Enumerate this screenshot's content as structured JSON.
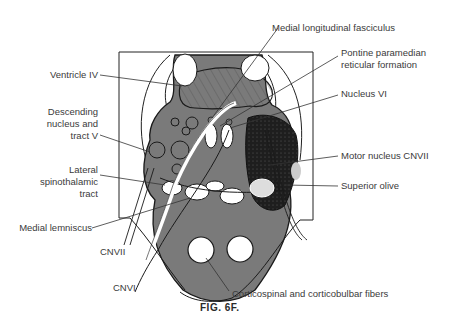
{
  "figure": {
    "caption": "FIG. 6F.",
    "colors": {
      "background": "#ffffff",
      "gray_tissue": "#7a7a7a",
      "dark_tissue": "#1e1e1e",
      "outline": "#1a1a1a",
      "label_text": "#3a3a3a"
    }
  },
  "labels": {
    "left": {
      "ventricle_iv": "Ventricle IV",
      "descending_nucleus_line1": "Descending",
      "descending_nucleus_line2": "nucleus and",
      "descending_nucleus_line3": "tract V",
      "lateral_spinothalamic_line1": "Lateral",
      "lateral_spinothalamic_line2": "spinothalamic",
      "lateral_spinothalamic_line3": "tract",
      "medial_lemniscus": "Medial lemniscus",
      "cnvii": "CNVII",
      "cnvi": "CNVI"
    },
    "right": {
      "medial_longitudinal_fasciculus": "Medial longitudinal fasciculus",
      "pontine_paramedian_line1": "Pontine paramedian",
      "pontine_paramedian_line2": "reticular formation",
      "nucleus_vi": "Nucleus VI",
      "motor_nucleus_cnvii": "Motor nucleus CNVII",
      "superior_olive": "Superior olive"
    },
    "bottom": {
      "corticospinal": "Corticospinal and corticobulbar fibers"
    }
  }
}
